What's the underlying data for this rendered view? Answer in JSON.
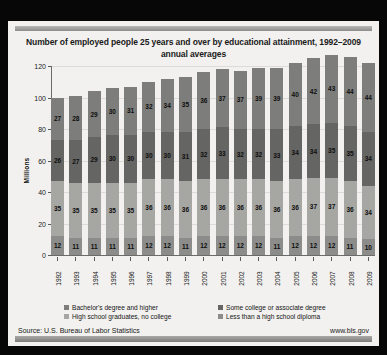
{
  "title": "Number of employed people 25 years and over by educational attainment, 1992–2009 annual averages",
  "footer": {
    "source": "Source: U.S. Bureau of Labor Statistics",
    "url": "www.bls.gov"
  },
  "colors": {
    "bachelors": "#7d7d7b",
    "some_college": "#656563",
    "hs_grad": "#a6a6a3",
    "less_than_hs": "#8c8c8a",
    "card_bg": "#f2f1ef",
    "grid": "#dcdbd8",
    "axis": "#6b6b69",
    "outer_bg": "#070707"
  },
  "chart_data": {
    "type": "bar",
    "stacked": true,
    "title": "Number of employed people 25 years and over by educational attainment, 1992–2009 annual averages",
    "xlabel": "",
    "ylabel": "Millions",
    "ylim": [
      0,
      120
    ],
    "yticks": [
      0,
      20,
      40,
      60,
      80,
      100,
      120
    ],
    "grid": true,
    "legend_position": "bottom",
    "categories": [
      "1992",
      "1993",
      "1994",
      "1995",
      "1996",
      "1997",
      "1998",
      "1999",
      "2000",
      "2001",
      "2002",
      "2003",
      "2004",
      "2005",
      "2006",
      "2007",
      "2008",
      "2009"
    ],
    "series": [
      {
        "name": "Less than a high school diploma",
        "color": "#8c8c8a",
        "values": [
          12,
          11,
          11,
          11,
          11,
          12,
          12,
          11,
          12,
          12,
          12,
          12,
          11,
          12,
          12,
          12,
          11,
          10
        ]
      },
      {
        "name": "High school graduates, no college",
        "color": "#a6a6a3",
        "values": [
          35,
          35,
          35,
          35,
          35,
          36,
          36,
          36,
          36,
          36,
          36,
          36,
          36,
          36,
          37,
          37,
          36,
          34
        ]
      },
      {
        "name": "Some college or associate degree",
        "color": "#656563",
        "values": [
          26,
          27,
          29,
          30,
          30,
          30,
          30,
          31,
          32,
          33,
          32,
          32,
          33,
          34,
          34,
          35,
          35,
          34
        ]
      },
      {
        "name": "Bachelor's degree and higher",
        "color": "#7d7d7b",
        "values": [
          27,
          28,
          29,
          30,
          31,
          32,
          34,
          35,
          36,
          37,
          37,
          39,
          39,
          40,
          42,
          43,
          44,
          44
        ]
      }
    ],
    "totals": [
      100,
      101,
      104,
      106,
      107,
      110,
      112,
      113,
      116,
      118,
      117,
      119,
      119,
      122,
      125,
      127,
      126,
      122
    ]
  },
  "legend": [
    {
      "label": "Bachelor's degree and higher",
      "color": "#7d7d7b"
    },
    {
      "label": "Some college or associate degree",
      "color": "#656563"
    },
    {
      "label": "High school graduates, no college",
      "color": "#a6a6a3"
    },
    {
      "label": "Less than a high school diploma",
      "color": "#8c8c8a"
    }
  ]
}
